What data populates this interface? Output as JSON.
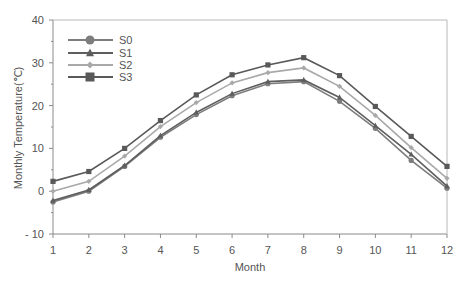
{
  "chart_data": {
    "type": "line",
    "title": "",
    "xlabel": "Month",
    "ylabel": "Monthly Temperature(℃)",
    "x": [
      1,
      2,
      3,
      4,
      5,
      6,
      7,
      8,
      9,
      10,
      11,
      12
    ],
    "xticks": [
      "1",
      "2",
      "3",
      "4",
      "5",
      "6",
      "7",
      "8",
      "9",
      "10",
      "11",
      "12"
    ],
    "yticks": [
      -10,
      0,
      10,
      20,
      30,
      40
    ],
    "ylim": [
      -10,
      40
    ],
    "xlim": [
      1,
      12
    ],
    "grid": false,
    "legend_position": "upper left",
    "series": [
      {
        "name": "S0",
        "marker": "circle",
        "color": "#7d7d7d",
        "values": [
          -2.5,
          0.0,
          5.8,
          12.6,
          17.9,
          22.3,
          25.1,
          25.6,
          21.0,
          14.7,
          7.2,
          0.7
        ]
      },
      {
        "name": "S1",
        "marker": "triangle",
        "color": "#5e5e5e",
        "values": [
          -2.2,
          0.3,
          6.0,
          13.0,
          18.4,
          22.8,
          25.6,
          26.0,
          21.9,
          15.3,
          8.6,
          1.2
        ]
      },
      {
        "name": "S2",
        "marker": "diamond",
        "color": "#a9a9a9",
        "values": [
          0.0,
          2.3,
          8.2,
          15.1,
          20.7,
          25.3,
          27.7,
          28.8,
          24.5,
          17.7,
          10.2,
          3.0
        ]
      },
      {
        "name": "S3",
        "marker": "square",
        "color": "#595959",
        "values": [
          2.3,
          4.6,
          10.0,
          16.5,
          22.5,
          27.2,
          29.5,
          31.2,
          27.0,
          19.8,
          12.8,
          5.8
        ]
      }
    ]
  },
  "colors": {
    "axis": "#8a8a8a",
    "text": "#555555"
  }
}
